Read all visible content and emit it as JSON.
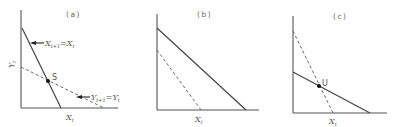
{
  "panels": [
    {
      "label": "(a)",
      "x_axis_label": "X",
      "x_axis_sub": "t",
      "y_axis_label": "Y",
      "y_axis_sub": "t",
      "point_label": "S",
      "solid_line_annotation": {
        "lhs": "X",
        "lhs_sub": "t+1",
        "rhs": "=X",
        "rhs_sub": "t"
      },
      "dashed_line_annotation": {
        "lhs": "Y",
        "lhs_sub": "t+1",
        "rhs": "=Y",
        "rhs_sub": "t"
      }
    },
    {
      "label": "(b)",
      "x_axis_label": "X",
      "x_axis_sub": "t"
    },
    {
      "label": "(c)",
      "x_axis_label": "X",
      "x_axis_sub": "t",
      "point_label": "U"
    }
  ]
}
